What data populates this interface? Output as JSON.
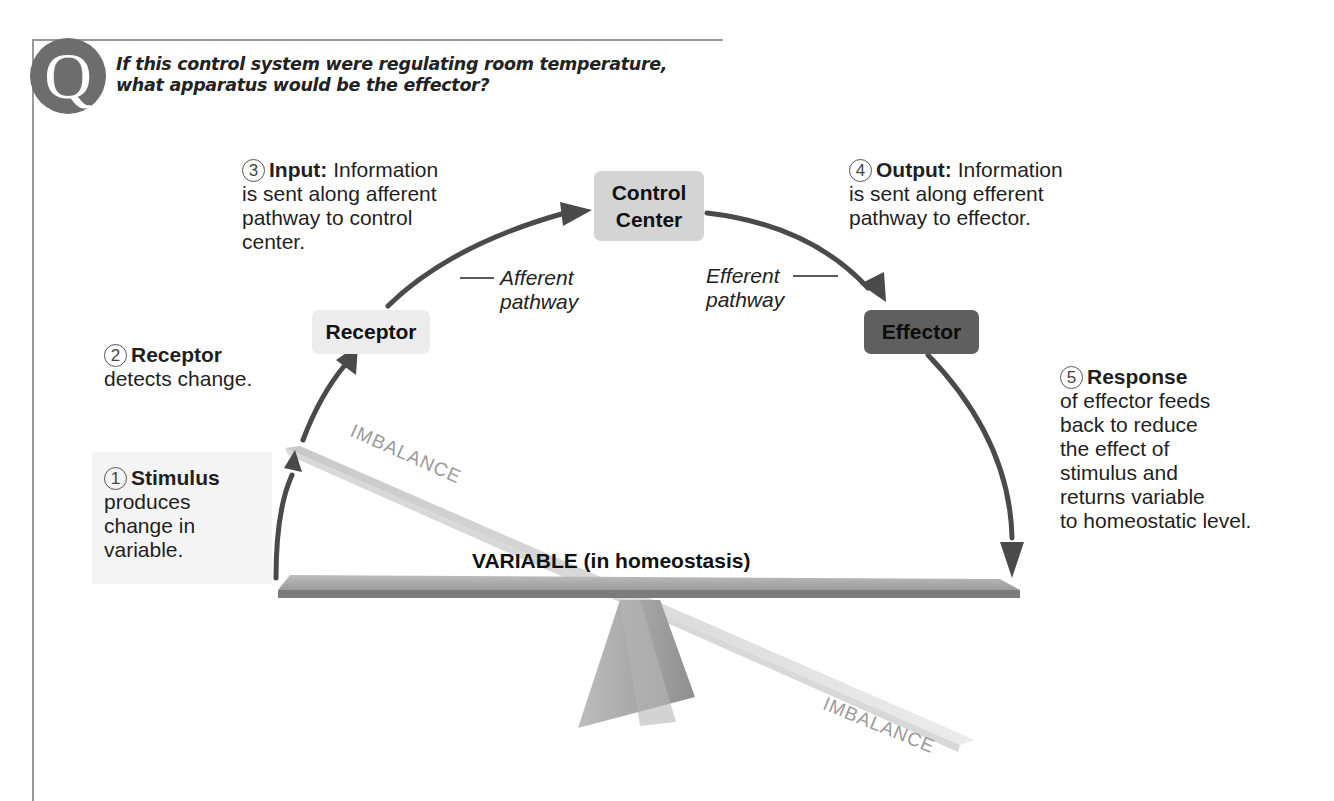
{
  "question": {
    "badge": "Q",
    "lines": [
      "If this control system were regulating room temperature,",
      "what apparatus would be the effector?"
    ]
  },
  "nodes": {
    "receptor": "Receptor",
    "control_center": [
      "Control",
      "Center"
    ],
    "effector": "Effector"
  },
  "pathways": {
    "afferent": [
      "Afferent",
      "pathway"
    ],
    "efferent": [
      "Efferent",
      "pathway"
    ]
  },
  "steps": [
    {
      "num": "1",
      "title": "Stimulus",
      "lines": [
        "produces",
        "change in",
        "variable."
      ]
    },
    {
      "num": "2",
      "title": "Receptor",
      "lines": [
        "detects change."
      ]
    },
    {
      "num": "3",
      "title": "Input:",
      "title_rest": "Information",
      "lines": [
        "is sent along afferent",
        "pathway to control",
        "center."
      ]
    },
    {
      "num": "4",
      "title": "Output:",
      "title_rest": "Information",
      "lines": [
        "is sent along efferent",
        "pathway to effector."
      ]
    },
    {
      "num": "5",
      "title": "Response",
      "lines": [
        "of effector feeds",
        "back to reduce",
        "the effect of",
        "stimulus and",
        "returns variable",
        "to homeostatic level."
      ]
    }
  ],
  "seesaw": {
    "variable_label": "VARIABLE (in homeostasis)",
    "imbalance_top": "IMBALANCE",
    "imbalance_bottom": "IMBALANCE"
  },
  "colors": {
    "arrow": "#4a4a4a",
    "receptor_box": "#ececec",
    "control_box": "#d4d4d4",
    "effector_box": "#5f5f5f",
    "badge": "#6d6d6d"
  }
}
